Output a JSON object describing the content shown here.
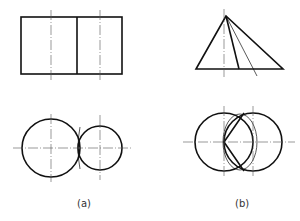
{
  "figure": {
    "type": "technical-drawing",
    "panels": [
      {
        "label": "(a)",
        "description": "Two intersecting cylinders of different diameters: front view rectangle split vertically, top view two overlapping circles"
      },
      {
        "label": "(b)",
        "description": "Cone intersecting a cylinder: front view triangle with section lines, top view two equal overlapping circles with intersection curve"
      }
    ]
  },
  "colors": {
    "line": "#111111",
    "centerline": "#555555"
  }
}
